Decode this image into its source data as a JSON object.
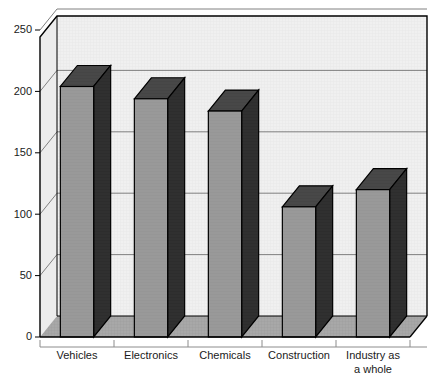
{
  "chart_data": {
    "type": "bar",
    "title": "",
    "subtitle": "",
    "xlabel": "",
    "ylabel": "",
    "categories": [
      "Vehicles",
      "Electronics",
      "Chemicals",
      "Construction",
      "Industry as\na whole"
    ],
    "category_lines": [
      [
        "Vehicles"
      ],
      [
        "Electronics"
      ],
      [
        "Chemicals"
      ],
      [
        "Construction"
      ],
      [
        "Industry as",
        "a whole"
      ]
    ],
    "values": [
      204,
      194,
      184,
      106,
      120
    ],
    "ylim": [
      0,
      250
    ],
    "yticks": [
      0,
      50,
      100,
      150,
      200,
      250
    ],
    "ytick_labels": [
      "0",
      "50",
      "100",
      "150",
      "200",
      "250"
    ],
    "grid": true,
    "grid_axis": "y",
    "legend": false,
    "legend_position": "none",
    "annotations": [],
    "style": {
      "three_d": true,
      "bar_front_color": "#999999",
      "bar_side_color": "#333333",
      "bar_top_color": "#4d4d4d",
      "plot_background": "#f2f2f2",
      "wall_background": "#ededed",
      "floor_color": "#a6a6a6",
      "gridline_color": "#808080",
      "frame_color": "#000000",
      "text_color": "#1a1a1a"
    }
  }
}
